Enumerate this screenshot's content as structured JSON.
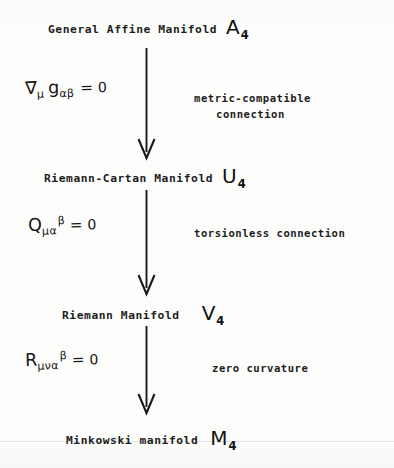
{
  "diagram": {
    "title_text": "General Affine Manifold",
    "nodes": [
      {
        "label": "General Affine Manifold",
        "symbol": "A",
        "subscript": "4"
      },
      {
        "label": "Riemann-Cartan Manifold",
        "symbol": "U",
        "subscript": "4"
      },
      {
        "label": "Riemann Manifold",
        "symbol": "V",
        "subscript": "4"
      },
      {
        "label": "Minkowski manifold",
        "symbol": "M",
        "subscript": "4"
      }
    ],
    "equations": [
      {
        "operator": "∇",
        "operator_sub": "μ",
        "tensor": "g",
        "tensor_sub": "αβ",
        "tensor_sup": "",
        "relation": "=",
        "value": "0",
        "plain": "∇μ gαβ = 0"
      },
      {
        "operator": "",
        "operator_sub": "",
        "tensor": "Q",
        "tensor_sub": "μα",
        "tensor_sup": "β",
        "relation": "=",
        "value": "0",
        "plain": "Qμα^β = 0"
      },
      {
        "operator": "",
        "operator_sub": "",
        "tensor": "R",
        "tensor_sub": "μνα",
        "tensor_sup": "β",
        "relation": "=",
        "value": "0",
        "plain": "Rμνα^β = 0"
      }
    ],
    "captions": [
      {
        "line1": "metric-compatible",
        "line2": "connection"
      },
      {
        "line1": "torsionless connection",
        "line2": ""
      },
      {
        "line1": "zero curvature",
        "line2": ""
      }
    ],
    "ink_color": "#1a1a1a",
    "background_color": "#fdfdfc"
  }
}
